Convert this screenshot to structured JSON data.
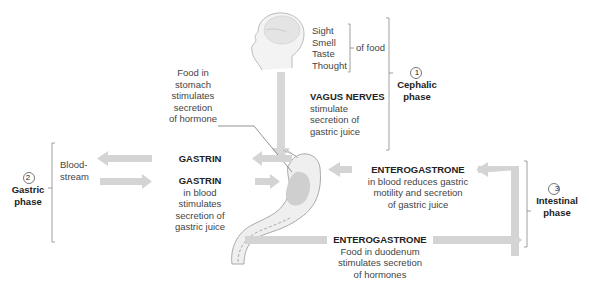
{
  "head": {
    "stimuli": [
      "Sight",
      "Smell",
      "Taste",
      "Thought"
    ],
    "stimuli_suffix": "of food"
  },
  "phases": {
    "cephalic": {
      "number": "1",
      "name": "Cephalic",
      "suffix": "phase"
    },
    "gastric": {
      "number": "2",
      "name": "Gastric",
      "suffix": "phase"
    },
    "intestinal": {
      "number": "3",
      "name": "Intestinal",
      "suffix": "phase"
    }
  },
  "vagus": {
    "title": "VAGUS NERVES",
    "lines": [
      "stimulate",
      "secretion of",
      "gastric juice"
    ]
  },
  "food_in_stomach": {
    "lines": [
      "Food in",
      "stomach",
      "stimulates",
      "secretion",
      "of hormone"
    ]
  },
  "gastrin_top": {
    "title": "GASTRIN"
  },
  "gastrin_bottom": {
    "title": "GASTRIN",
    "lines": [
      "in blood",
      "stimulates",
      "secretion of",
      "gastric juice"
    ]
  },
  "bloodstream": {
    "lines": [
      "Blood-",
      "stream"
    ]
  },
  "enterogastrone_top": {
    "title": "ENTEROGASTRONE",
    "lines": [
      "in blood reduces gastric",
      "motility and secretion",
      "of gastric juice"
    ]
  },
  "enterogastrone_bottom": {
    "title": "ENTEROGASTRONE",
    "lines": [
      "Food in duodenum",
      "stimulates secretion",
      "of hormones"
    ]
  },
  "colors": {
    "arrow": "#d4d4d4",
    "arrow_edge": "#bdbdbd",
    "line": "#888888",
    "stomach_fill": "#eeeeee",
    "stomach_inner": "#cfcfcf"
  }
}
